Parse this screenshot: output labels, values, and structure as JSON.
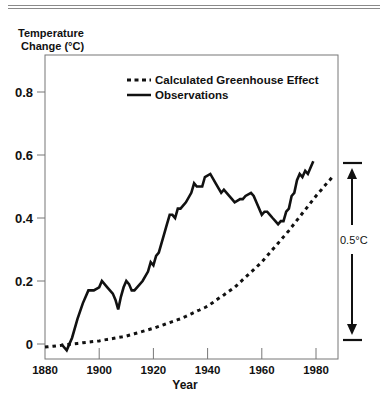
{
  "chart_data": {
    "type": "line",
    "title": "",
    "ylabel": "Temperature Change (°C)",
    "ylabel_lines": [
      "Temperature",
      "Change (°C)"
    ],
    "xlabel": "Year",
    "xlim": [
      1880,
      1988
    ],
    "ylim": [
      -0.05,
      0.9
    ],
    "x_ticks": [
      "1880",
      "1900",
      "1920",
      "1940",
      "1960",
      "1980"
    ],
    "y_ticks": [
      "0",
      "0.2",
      "0.4",
      "0.6",
      "0.8"
    ],
    "grid": false,
    "legend_position": "upper center",
    "legend": [
      {
        "name": "Calculated Greenhouse Effect",
        "style": "dotted"
      },
      {
        "name": "Observations",
        "style": "solid"
      }
    ],
    "series": [
      {
        "name": "Calculated Greenhouse Effect",
        "x": [
          1880,
          1890,
          1900,
          1910,
          1920,
          1930,
          1940,
          1950,
          1960,
          1970,
          1980,
          1986
        ],
        "values": [
          -0.01,
          0.0,
          0.01,
          0.025,
          0.05,
          0.08,
          0.12,
          0.18,
          0.26,
          0.36,
          0.47,
          0.53
        ]
      },
      {
        "name": "Observations",
        "x": [
          1886,
          1888,
          1890,
          1892,
          1894,
          1896,
          1898,
          1900,
          1901,
          1903,
          1905,
          1906,
          1907,
          1908,
          1909,
          1910,
          1911,
          1912,
          1913,
          1914,
          1916,
          1918,
          1919,
          1920,
          1921,
          1922,
          1924,
          1925,
          1926,
          1927,
          1928,
          1929,
          1930,
          1932,
          1934,
          1935,
          1936,
          1938,
          1939,
          1941,
          1943,
          1945,
          1946,
          1947,
          1949,
          1950,
          1952,
          1953,
          1954,
          1956,
          1957,
          1958,
          1960,
          1961,
          1962,
          1963,
          1964,
          1965,
          1966,
          1967,
          1968,
          1969,
          1970,
          1971,
          1972,
          1973,
          1974,
          1975,
          1976,
          1977,
          1978,
          1979
        ],
        "values": [
          0.0,
          -0.02,
          0.02,
          0.08,
          0.13,
          0.17,
          0.17,
          0.18,
          0.2,
          0.18,
          0.16,
          0.14,
          0.11,
          0.15,
          0.18,
          0.2,
          0.19,
          0.17,
          0.17,
          0.18,
          0.2,
          0.23,
          0.26,
          0.25,
          0.28,
          0.29,
          0.35,
          0.38,
          0.41,
          0.41,
          0.4,
          0.43,
          0.43,
          0.45,
          0.48,
          0.51,
          0.5,
          0.5,
          0.53,
          0.54,
          0.51,
          0.48,
          0.49,
          0.48,
          0.46,
          0.45,
          0.46,
          0.46,
          0.47,
          0.48,
          0.47,
          0.45,
          0.41,
          0.42,
          0.42,
          0.41,
          0.4,
          0.39,
          0.38,
          0.39,
          0.39,
          0.42,
          0.43,
          0.47,
          0.48,
          0.52,
          0.54,
          0.53,
          0.55,
          0.54,
          0.56,
          0.58
        ]
      }
    ],
    "annotations": [
      {
        "text": "0.5°C",
        "type": "bracket-arrow",
        "from": 0.0,
        "to": 0.57
      }
    ]
  },
  "axis": {
    "ylabel_line1": "Temperature",
    "ylabel_line2": "Change (°C)",
    "xlabel": "Year"
  },
  "legend": {
    "calc": "Calculated Greenhouse Effect",
    "obs": "Observations"
  },
  "annotation": {
    "bracket_label": "0.5°C"
  }
}
